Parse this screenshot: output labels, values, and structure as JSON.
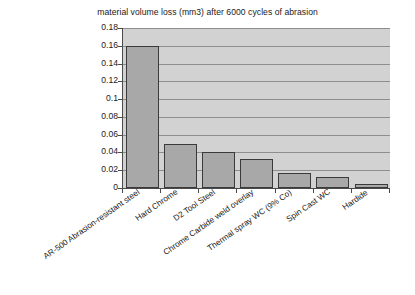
{
  "chart_data": {
    "type": "bar",
    "title": "material volume loss (mm3) after 6000 cycles of abrasion",
    "xlabel": "",
    "ylabel": "",
    "ylim": [
      0,
      0.18
    ],
    "ytick_labels": [
      "0.18",
      "0.16",
      "0.14",
      "0.12",
      "0.1",
      "0.08",
      "0.06",
      "0.04",
      "0.02",
      "0"
    ],
    "ytick_values": [
      0.18,
      0.16,
      0.14,
      0.12,
      0.1,
      0.08,
      0.06,
      0.04,
      0.02,
      0
    ],
    "grid": true,
    "legend": "none",
    "categories": [
      "AR-500 Abrasion-resistant steel",
      "Hard Chrome",
      "D2 Tool Steel",
      "Chrome Carbide weld overlay",
      "Thermal spray WC (9% Co)",
      "Spin Cast WC",
      "Hardide"
    ],
    "values": [
      0.16,
      0.05,
      0.04,
      0.033,
      0.0165,
      0.0125,
      0.004
    ],
    "series": [
      {
        "name": "material volume loss (mm3)",
        "values": [
          0.16,
          0.05,
          0.04,
          0.033,
          0.0165,
          0.0125,
          0.004
        ]
      }
    ],
    "colors": {
      "bar_fill": "#a8a8a8",
      "bar_border": "#3a3a3a",
      "plot_background": "#d2d2d2",
      "gridline": "#8e8e8e",
      "axis": "#4a4a4a",
      "text": "#1a1a1a",
      "page_background": "#ffffff"
    }
  }
}
